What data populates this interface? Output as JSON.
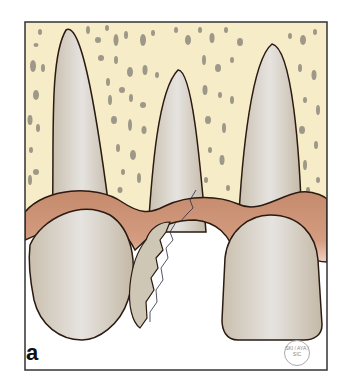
{
  "figure": {
    "panel_label": "a",
    "stamp_text": "SKI / AYA / SIC",
    "colors": {
      "bone": "#f6ecc8",
      "bone_pores": "#8f8a7e",
      "tooth": "#d2c8b8",
      "tooth_highlight": "#e4e0dc",
      "gingiva": "#c98f72",
      "gingiva_light": "#e8c0ae",
      "outline": "#2a1a12",
      "frame": "#333333",
      "background": "#ffffff"
    }
  }
}
